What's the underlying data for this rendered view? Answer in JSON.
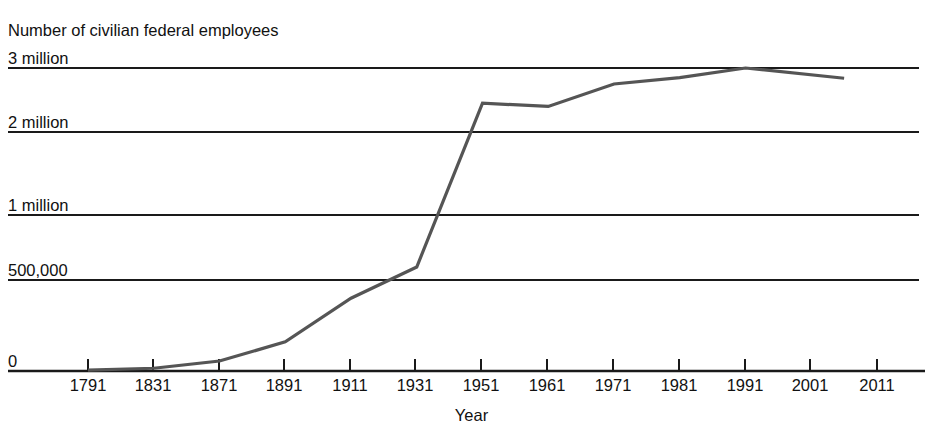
{
  "chart_data": {
    "type": "line",
    "title": "",
    "ylabel": "Number of civilian federal employees",
    "xlabel": "Year",
    "grid": true,
    "legend": "none",
    "y_tick_labels": [
      "0",
      "500,000",
      "1 million",
      "2 million",
      "3 million"
    ],
    "y_tick_values": [
      0,
      500000,
      1000000,
      2000000,
      3000000
    ],
    "y_axis_note": "non-linear spacing: evenly spaced gridlines at 0, 500,000, 1M, 2M, 3M",
    "x_tick_labels": [
      "1791",
      "1831",
      "1871",
      "1891",
      "1911",
      "1931",
      "1951",
      "1961",
      "1971",
      "1981",
      "1991",
      "2001",
      "2011"
    ],
    "x_tick_values": [
      1791,
      1831,
      1871,
      1891,
      1911,
      1931,
      1951,
      1961,
      1971,
      1981,
      1991,
      2001,
      2011
    ],
    "x_axis_note": "non-uniform year spacing: 40-year steps to 1871, then 20-year step, then 20-year steps to 1931, then 20 to 1951, then 10-year steps",
    "series": [
      {
        "name": "Civilian federal employees",
        "color": "#555555",
        "line_width": 3,
        "x": [
          1791,
          1831,
          1871,
          1891,
          1911,
          1931,
          1951,
          1961,
          1971,
          1981,
          1991,
          2006
        ],
        "values": [
          5000,
          15000,
          55000,
          160000,
          400000,
          600000,
          2450000,
          2400000,
          2750000,
          2850000,
          3000000,
          2840000
        ]
      }
    ]
  },
  "axis": {
    "y_title": "Number of civilian federal employees",
    "x_title": "Year"
  }
}
